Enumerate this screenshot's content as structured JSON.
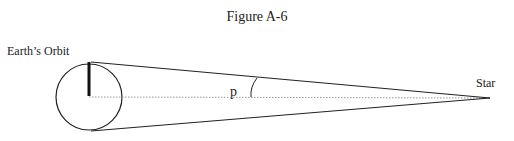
{
  "figure": {
    "title": "Figure A-6",
    "labels": {
      "orbit": "Earth’s Orbit",
      "star": "Star",
      "angle": "p"
    },
    "colors": {
      "line": "#222222",
      "dotted": "#999999",
      "background": "#ffffff"
    }
  }
}
